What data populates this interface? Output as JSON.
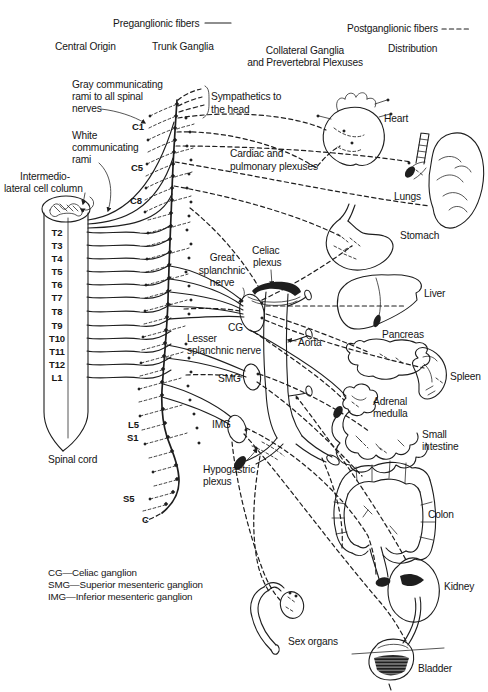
{
  "figure": {
    "fiber_key": {
      "preganglionic_label": "Preganglionic fibers",
      "postganglionic_label": "Postganglionic fibers"
    },
    "column_headers": {
      "central_origin": "Central Origin",
      "trunk_ganglia": "Trunk Ganglia",
      "collateral_line1": "Collateral Ganglia",
      "collateral_line2": "and Prevertebral Plexuses",
      "distribution": "Distribution"
    },
    "annotations": {
      "gray_rami": [
        "Gray communicating",
        "rami to all spinal",
        "nerves"
      ],
      "sympathetics_head": [
        "Sympathetics to",
        "the head"
      ],
      "white_rami": [
        "White",
        "communicating",
        "rami"
      ],
      "intermediolateral": [
        "Intermedio-",
        "lateral cell column"
      ],
      "cardiac_pulmonary": [
        "Cardiac and",
        "pulmonary plexuses"
      ],
      "great_splanchnic": [
        "Great",
        "splanchnic",
        "nerve"
      ],
      "celiac_plexus": [
        "Celiac",
        "plexus"
      ],
      "lesser_splanchnic": [
        "Lesser",
        "splanchnic nerve"
      ],
      "hypogastric_plexus": [
        "Hypogastric",
        "plexus"
      ],
      "aorta": "Aorta",
      "cg": "CG",
      "smg": "SMG",
      "img": "IMG",
      "spinal_cord": "Spinal cord"
    },
    "spinal_levels": {
      "cervical": [
        "C1",
        "C5",
        "C8"
      ],
      "thoracolumbar": [
        "T2",
        "T3",
        "T4",
        "T5",
        "T6",
        "T7",
        "T8",
        "T9",
        "T10",
        "T11",
        "T12",
        "L1"
      ],
      "lumbosacral": [
        "L5",
        "S1",
        "S5",
        "C"
      ]
    },
    "organs": {
      "heart": "Heart",
      "lungs": "Lungs",
      "stomach": "Stomach",
      "liver": "Liver",
      "pancreas": "Pancreas",
      "spleen": "Spleen",
      "adrenal_medulla": [
        "Adrenal",
        "medulla"
      ],
      "small_intestine": [
        "Small",
        "intestine"
      ],
      "colon": "Colon",
      "kidney": "Kidney",
      "sex_organs": "Sex organs",
      "bladder": "Bladder"
    },
    "abbreviation_key": [
      "CG—Celiac ganglion",
      "SMG—Superior mesenteric ganglion",
      "IMG—Inferior mesenteric ganglion"
    ],
    "colors": {
      "ink": "#1e1e1e",
      "paper": "#ffffff"
    }
  }
}
